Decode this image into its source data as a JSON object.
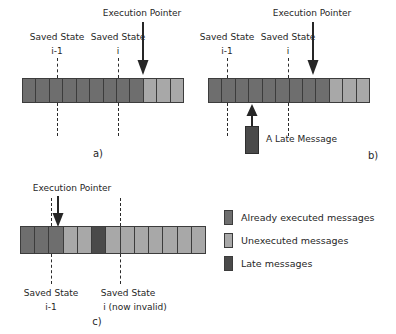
{
  "figure": {
    "colors": {
      "executed": "#6e6e6e",
      "unexecuted": "#a8a8a8",
      "late": "#4a4a4a",
      "outline": "#3c3c3c",
      "text": "#262626",
      "background": "#ffffff"
    }
  },
  "panels": [
    {
      "id": "a",
      "tag": "a)",
      "execution_pointer_label": "Execution Pointer",
      "saved_state_1": {
        "line1": "Saved State",
        "line2": "i-1"
      },
      "saved_state_2": {
        "line1": "Saved State",
        "line2": "i"
      },
      "cell_count": 12,
      "executed_count": 9,
      "cells": [
        "executed",
        "executed",
        "executed",
        "executed",
        "executed",
        "executed",
        "executed",
        "executed",
        "executed",
        "unexecuted",
        "unexecuted",
        "unexecuted"
      ]
    },
    {
      "id": "b",
      "tag": "b)",
      "execution_pointer_label": "Execution Pointer",
      "saved_state_1": {
        "line1": "Saved State",
        "line2": "i-1"
      },
      "saved_state_2": {
        "line1": "Saved State",
        "line2": "i"
      },
      "late_message_label": "A Late Message",
      "cell_count": 12,
      "executed_count": 9,
      "cells": [
        "executed",
        "executed",
        "executed",
        "executed",
        "executed",
        "executed",
        "executed",
        "executed",
        "executed",
        "unexecuted",
        "unexecuted",
        "unexecuted"
      ]
    },
    {
      "id": "c",
      "tag": "c)",
      "execution_pointer_label": "Execution Pointer",
      "saved_state_1": {
        "line1": "Saved State",
        "line2": "i-1"
      },
      "saved_state_2": {
        "line1": "Saved State",
        "line2": "i (now invalid)"
      },
      "cell_count": 13,
      "late_index": 5,
      "cells": [
        "executed",
        "executed",
        "executed",
        "unexecuted",
        "unexecuted",
        "late",
        "unexecuted",
        "unexecuted",
        "unexecuted",
        "unexecuted",
        "unexecuted",
        "unexecuted",
        "unexecuted"
      ]
    }
  ],
  "legend": {
    "items": [
      {
        "swatch": "executed",
        "label": "Already executed messages"
      },
      {
        "swatch": "unexecuted",
        "label": "Unexecuted messages"
      },
      {
        "swatch": "late",
        "label": "Late messages"
      }
    ]
  }
}
